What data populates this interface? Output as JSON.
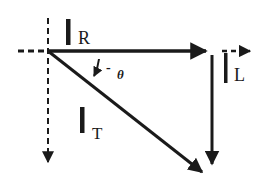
{
  "diagram": {
    "type": "phasor-diagram",
    "vectors": [
      {
        "id": "IR",
        "symbol": "I",
        "subscript": "R",
        "direction": "horizontal-right",
        "style": "solid"
      },
      {
        "id": "IL",
        "symbol": "I",
        "subscript": "L",
        "direction": "vertical-down",
        "style": "solid"
      },
      {
        "id": "IT",
        "symbol": "I",
        "subscript": "T",
        "direction": "diagonal-down-right",
        "style": "solid"
      }
    ],
    "reference_axes": [
      {
        "id": "x-axis",
        "style": "dashed",
        "direction": "right"
      },
      {
        "id": "y-axis",
        "style": "dashed",
        "direction": "down"
      }
    ],
    "angle": {
      "label": "-θ",
      "sign": "-",
      "symbol": "θ"
    },
    "colors": {
      "ink": "#1a1a1a",
      "background": "#ffffff"
    }
  },
  "labels": {
    "ir_main": "I",
    "ir_sub": "R",
    "il_main": "I",
    "il_sub": "L",
    "it_main": "I",
    "it_sub": "T",
    "angle_sign": "-",
    "angle_symbol": "θ"
  }
}
